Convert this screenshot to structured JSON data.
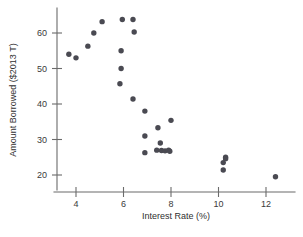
{
  "chart_data": {
    "type": "scatter",
    "title": "",
    "xlabel": "Interest Rate (%)",
    "ylabel": "Amount Borrowed ($2013 T)",
    "xlim": [
      3.1,
      13.0
    ],
    "ylim": [
      15.5,
      66.5
    ],
    "xticks": [
      4,
      6,
      8,
      10,
      12
    ],
    "xticklabels": [
      "4",
      "6",
      "8",
      "10",
      "12"
    ],
    "yticks": [
      20,
      30,
      40,
      50,
      60
    ],
    "yticklabels": [
      "20",
      "30",
      "40",
      "50",
      "60"
    ],
    "grid": false,
    "legend": null,
    "marker": "filled-circle",
    "marker_color": "#4a4a52",
    "points": [
      {
        "x": 3.7,
        "y": 54.0
      },
      {
        "x": 4.0,
        "y": 53.0
      },
      {
        "x": 4.5,
        "y": 56.3
      },
      {
        "x": 4.75,
        "y": 60.0
      },
      {
        "x": 5.1,
        "y": 63.2
      },
      {
        "x": 5.95,
        "y": 63.8
      },
      {
        "x": 6.4,
        "y": 63.8
      },
      {
        "x": 6.45,
        "y": 60.3
      },
      {
        "x": 5.9,
        "y": 55.0
      },
      {
        "x": 5.9,
        "y": 50.0
      },
      {
        "x": 5.85,
        "y": 45.7
      },
      {
        "x": 6.4,
        "y": 41.4
      },
      {
        "x": 6.9,
        "y": 38.0
      },
      {
        "x": 8.0,
        "y": 35.4
      },
      {
        "x": 7.45,
        "y": 33.3
      },
      {
        "x": 6.9,
        "y": 31.0
      },
      {
        "x": 7.55,
        "y": 29.0
      },
      {
        "x": 6.9,
        "y": 26.3
      },
      {
        "x": 7.4,
        "y": 27.0
      },
      {
        "x": 7.6,
        "y": 26.9
      },
      {
        "x": 7.75,
        "y": 26.8
      },
      {
        "x": 7.9,
        "y": 27.0
      },
      {
        "x": 7.95,
        "y": 26.7
      },
      {
        "x": 10.3,
        "y": 25.0
      },
      {
        "x": 10.3,
        "y": 24.6
      },
      {
        "x": 10.2,
        "y": 23.5
      },
      {
        "x": 10.2,
        "y": 21.4
      },
      {
        "x": 12.4,
        "y": 19.5
      }
    ]
  }
}
